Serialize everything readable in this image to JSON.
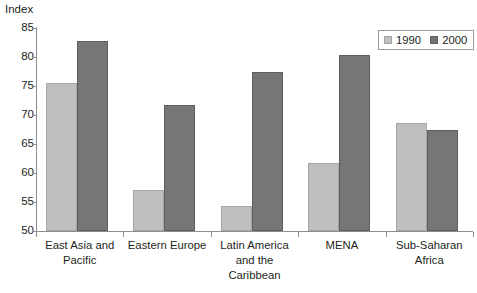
{
  "chart_data": {
    "type": "bar",
    "title": "",
    "subtitle": "",
    "xlabel": "",
    "ylabel": "Index",
    "ylim": [
      50,
      85
    ],
    "ytick_labels": [
      "85",
      "80",
      "75",
      "70",
      "65",
      "60",
      "55",
      "50"
    ],
    "yticks": [
      85,
      80,
      75,
      70,
      65,
      60,
      55,
      50
    ],
    "grid": false,
    "legend_position": "top-right",
    "categories": [
      "East Asia and Pacific",
      "Eastern Europe",
      "Latin America and the Caribbean",
      "MENA",
      "Sub-Saharan Africa"
    ],
    "category_lines": [
      [
        "East Asia and",
        "Pacific"
      ],
      [
        "Eastern Europe"
      ],
      [
        "Latin America",
        "and the",
        "Caribbean"
      ],
      [
        "MENA"
      ],
      [
        "Sub-Saharan",
        "Africa"
      ]
    ],
    "series": [
      {
        "name": "1990",
        "color": "#bfbfbf",
        "values": [
          75.6,
          57.0,
          54.3,
          61.8,
          68.6
        ]
      },
      {
        "name": "2000",
        "color": "#767676",
        "values": [
          82.8,
          71.7,
          77.4,
          80.4,
          67.5
        ]
      }
    ],
    "annotations": []
  },
  "legend": {
    "entries": [
      {
        "label": "1990",
        "swatch": "legend-swatch-1990"
      },
      {
        "label": "2000",
        "swatch": "legend-swatch-2000"
      }
    ]
  },
  "colors": {
    "series_1990": "#bfbfbf",
    "series_2000": "#767676",
    "axis": "#8d8d8d",
    "text": "#231f20",
    "background": "#ffffff"
  }
}
